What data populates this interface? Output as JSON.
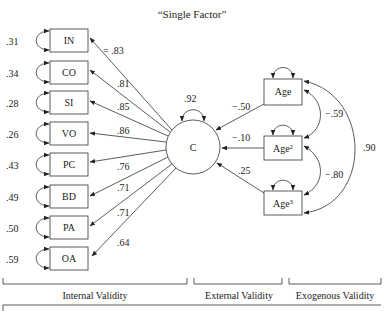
{
  "title": "“Single Factor”",
  "factor": {
    "label": "C",
    "variance": ".92"
  },
  "indicators": [
    {
      "label": "IN",
      "error": ".31",
      "loading": "= .83"
    },
    {
      "label": "CO",
      "error": ".34",
      "loading": ".81"
    },
    {
      "label": "SI",
      "error": ".28",
      "loading": ".85"
    },
    {
      "label": "VO",
      "error": ".26",
      "loading": ".86"
    },
    {
      "label": "PC",
      "error": ".43",
      "loading": ".76"
    },
    {
      "label": "BD",
      "error": ".49",
      "loading": ".71"
    },
    {
      "label": "PA",
      "error": ".50",
      "loading": ".71"
    },
    {
      "label": "OA",
      "error": ".59",
      "loading": ".64"
    }
  ],
  "predictors": [
    {
      "label": "Age",
      "sup": "",
      "path": "−.50"
    },
    {
      "label": "Age",
      "sup": "2",
      "path": "−.10"
    },
    {
      "label": "Age",
      "sup": "3",
      "path": ".25"
    }
  ],
  "correlations": {
    "age_age2": "−.59",
    "age2_age3": "−.80",
    "age_age3": ".90"
  },
  "brackets": {
    "internal": "Internal Validity",
    "external": "External Validity",
    "exogenous": "Exogenous Validity"
  },
  "colors": {
    "stroke": "#333333",
    "background": "#ffffff",
    "text": "#222222"
  }
}
